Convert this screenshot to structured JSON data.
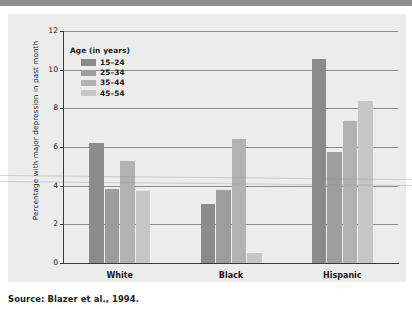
{
  "figure": {
    "source_caption": "Source: Blazer et al., 1994."
  },
  "chart_data": {
    "type": "bar",
    "title": "",
    "subtitle": "",
    "xlabel": "",
    "ylabel": "Percentage with major depression in past month",
    "categories": [
      "White",
      "Black",
      "Hispanic"
    ],
    "series": [
      {
        "name": "15–24",
        "color": "#8b8b8b",
        "values": [
          6.2,
          3.05,
          10.55
        ]
      },
      {
        "name": "25–34",
        "color": "#9d9d9d",
        "values": [
          3.85,
          3.8,
          5.75
        ]
      },
      {
        "name": "35–44",
        "color": "#b2b2b2",
        "values": [
          5.3,
          6.4,
          7.35
        ]
      },
      {
        "name": "45–54",
        "color": "#c6c6c6",
        "values": [
          3.7,
          0.5,
          8.4
        ]
      }
    ],
    "ylim": [
      0,
      12
    ],
    "yticks": [
      0,
      2,
      4,
      6,
      8,
      10,
      12
    ],
    "ytick_labels": [
      "0",
      "2",
      "4",
      "6",
      "8",
      "10",
      "12"
    ],
    "grid": true,
    "legend": {
      "title": "Age (in years)",
      "position": "upper-left-inside",
      "entries": [
        "15–24",
        "25–34",
        "35–44",
        "45–54"
      ]
    },
    "colors": {
      "panel_background": "#ececed",
      "page_background": "#ffffff",
      "gridline": "#8c8c8c",
      "axis": "#3a3a3a",
      "text": "#1c1c1c",
      "top_strip": "#8f8f8f"
    }
  }
}
